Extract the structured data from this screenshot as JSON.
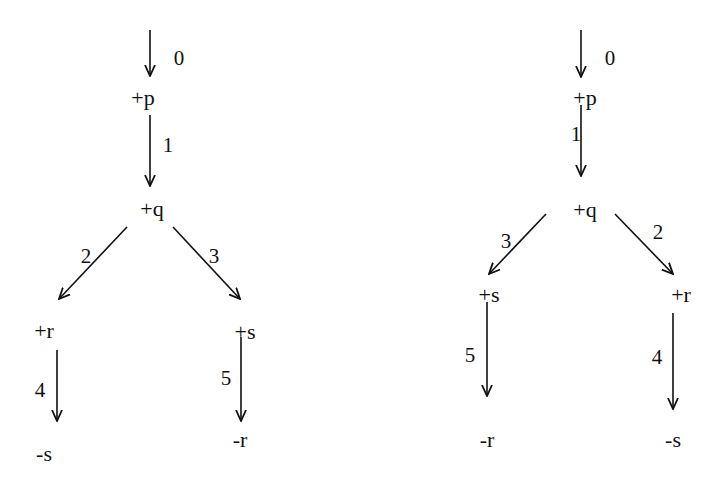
{
  "colors": {
    "ink": "#111111",
    "background": "#ffffff"
  },
  "trees": [
    {
      "id": "left",
      "nodes": [
        {
          "id": "p",
          "label": "+p",
          "x": 143,
          "y": 98
        },
        {
          "id": "q",
          "label": "+q",
          "x": 152,
          "y": 209
        },
        {
          "id": "r",
          "label": "+r",
          "x": 44,
          "y": 331
        },
        {
          "id": "s",
          "label": "+s",
          "x": 245,
          "y": 332
        },
        {
          "id": "neg_s",
          "label": "-s",
          "x": 44,
          "y": 454
        },
        {
          "id": "neg_r",
          "label": "-r",
          "x": 240,
          "y": 440
        }
      ],
      "edges": [
        {
          "step": "0",
          "from": [
            150,
            30
          ],
          "to": [
            150,
            76
          ],
          "label_pos": [
            179,
            58
          ]
        },
        {
          "step": "1",
          "from": [
            150,
            115
          ],
          "to": [
            150,
            186
          ],
          "label_pos": [
            168,
            145
          ]
        },
        {
          "step": "2",
          "from": [
            127,
            227
          ],
          "to": [
            59,
            299
          ],
          "label_pos": [
            86,
            256
          ]
        },
        {
          "step": "3",
          "from": [
            173,
            227
          ],
          "to": [
            240,
            299
          ],
          "label_pos": [
            214,
            256
          ]
        },
        {
          "step": "4",
          "from": [
            57,
            350
          ],
          "to": [
            57,
            421
          ],
          "label_pos": [
            40,
            390
          ]
        },
        {
          "step": "5",
          "from": [
            241,
            337
          ],
          "to": [
            241,
            421
          ],
          "label_pos": [
            226,
            378
          ]
        }
      ]
    },
    {
      "id": "right",
      "nodes": [
        {
          "id": "p",
          "label": "+p",
          "x": 585,
          "y": 98
        },
        {
          "id": "q",
          "label": "+q",
          "x": 585,
          "y": 210
        },
        {
          "id": "s",
          "label": "+s",
          "x": 489,
          "y": 295
        },
        {
          "id": "r",
          "label": "+r",
          "x": 681,
          "y": 295
        },
        {
          "id": "neg_r",
          "label": "-r",
          "x": 487,
          "y": 440
        },
        {
          "id": "neg_s",
          "label": "-s",
          "x": 673,
          "y": 440
        }
      ],
      "edges": [
        {
          "step": "0",
          "from": [
            581,
            30
          ],
          "to": [
            581,
            77
          ],
          "label_pos": [
            610,
            58
          ]
        },
        {
          "step": "1",
          "from": [
            581,
            105
          ],
          "to": [
            581,
            176
          ],
          "label_pos": [
            576,
            134
          ]
        },
        {
          "step": "3",
          "from": [
            546,
            214
          ],
          "to": [
            489,
            274
          ],
          "label_pos": [
            506,
            241
          ]
        },
        {
          "step": "2",
          "from": [
            615,
            214
          ],
          "to": [
            673,
            274
          ],
          "label_pos": [
            658,
            232
          ]
        },
        {
          "step": "5",
          "from": [
            487,
            302
          ],
          "to": [
            487,
            396
          ],
          "label_pos": [
            470,
            355
          ]
        },
        {
          "step": "4",
          "from": [
            673,
            313
          ],
          "to": [
            673,
            409
          ],
          "label_pos": [
            657,
            357
          ]
        }
      ]
    }
  ]
}
